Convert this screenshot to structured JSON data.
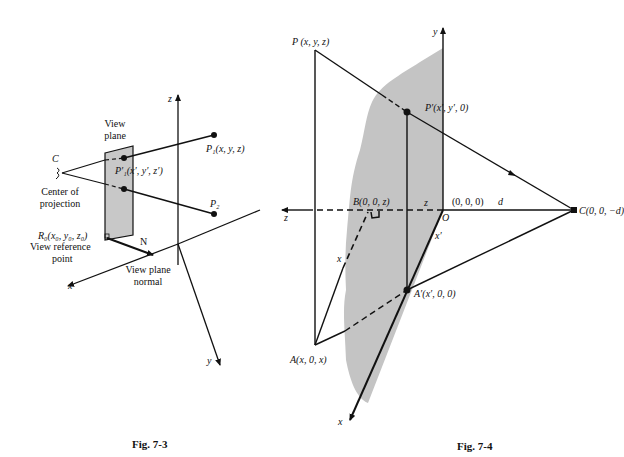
{
  "fig73": {
    "caption": "Fig. 7-3",
    "axis_z": "z",
    "axis_x": "x",
    "axis_y": "y",
    "c_label": "C",
    "center_of_projection_1": "Center of",
    "center_of_projection_2": "projection",
    "view_plane_1": "View",
    "view_plane_2": "plane",
    "p1_label": "P₁(x, y, z)",
    "p1prime_label": "P′₁(x′, y′, z′)",
    "p2_label": "P₂",
    "r0_label": "R₀(x₀, y₀, z₀)",
    "view_ref_1": "View reference",
    "view_ref_2": "point",
    "n_label": "N",
    "normal_1": "View plane",
    "normal_2": "normal"
  },
  "fig74": {
    "caption": "Fig. 7-4",
    "axis_y": "y",
    "axis_z": "z",
    "axis_x": "x",
    "p_label": "P (x, y, z)",
    "pprime_label": "P′(x′, y′, 0)",
    "b_label": "B(0, 0, z)",
    "z_seg": "z",
    "origin_coords": "(0, 0, 0)",
    "d_label": "d",
    "origin_label": "O",
    "c_label": "C(0, 0, −d)",
    "xprime_seg": "x′",
    "x_seg": "x",
    "aprime_label": "A′(x′, 0, 0)",
    "a_label": "A(x, 0, x)"
  }
}
